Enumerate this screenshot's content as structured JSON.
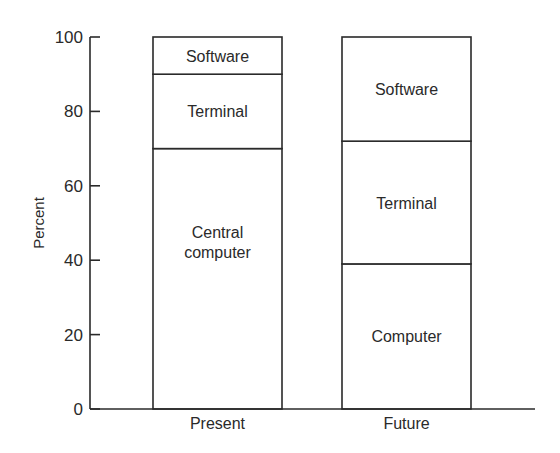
{
  "chart_data": {
    "type": "bar",
    "stacked": true,
    "title": "",
    "xlabel": "",
    "ylabel": "Percent",
    "ylim": [
      0,
      100
    ],
    "yticks": [
      0,
      20,
      40,
      60,
      80,
      100
    ],
    "grid": false,
    "legend": "none (segments labeled inline)",
    "categories": [
      "Present",
      "Future"
    ],
    "bars": [
      {
        "category": "Present",
        "segments": [
          {
            "label": "Central computer",
            "lines": [
              "Central",
              "computer"
            ],
            "from": 0,
            "to": 70,
            "value": 70
          },
          {
            "label": "Terminal",
            "lines": [
              "Terminal"
            ],
            "from": 70,
            "to": 90,
            "value": 20
          },
          {
            "label": "Software",
            "lines": [
              "Software"
            ],
            "from": 90,
            "to": 100,
            "value": 10
          }
        ]
      },
      {
        "category": "Future",
        "segments": [
          {
            "label": "Computer",
            "lines": [
              "Computer"
            ],
            "from": 0,
            "to": 39,
            "value": 39
          },
          {
            "label": "Terminal",
            "lines": [
              "Terminal"
            ],
            "from": 39,
            "to": 72,
            "value": 33
          },
          {
            "label": "Software",
            "lines": [
              "Software"
            ],
            "from": 72,
            "to": 100,
            "value": 28
          }
        ]
      }
    ]
  }
}
